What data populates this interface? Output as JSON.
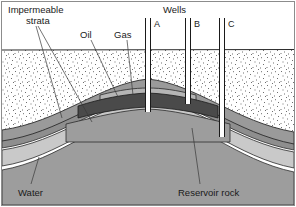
{
  "figure": {
    "title_text_present": false,
    "frame_color": "#8c8c8c",
    "background": "#ffffff"
  },
  "labels": {
    "impermeable_strata_line1": "Impermeable",
    "impermeable_strata_line2": "strata",
    "oil": "Oil",
    "gas": "Gas",
    "wells_header": "Wells",
    "well_a": "A",
    "well_b": "B",
    "well_c": "C",
    "water": "Water",
    "reservoir_rock": "Reservoir rock"
  },
  "layers": {
    "overburden": {
      "name": "overburden-stippled-rock",
      "fill": "#ffffff",
      "texture": "stipple-dots",
      "stroke": "#2b2b2b"
    },
    "cap_rock": {
      "name": "impermeable-cap-rock",
      "fill": "#9a9a9a",
      "stroke": "#2b2b2b"
    },
    "gas_cap": {
      "name": "gas-cap",
      "fill": "#b5b5b5",
      "stroke": "#2b2b2b"
    },
    "oil": {
      "name": "oil-zone",
      "fill": "#4a4a4a",
      "stroke": "#1a1a1a"
    },
    "reservoir_rock": {
      "name": "reservoir-rock",
      "fill": "#9d9d9d",
      "stroke": "#2b2b2b"
    },
    "water": {
      "name": "water-zone",
      "fill": "#c9c9c9",
      "stroke": "#2b2b2b"
    },
    "lower_seal": {
      "name": "lower-impermeable-strata",
      "fill": "#8e8e8e",
      "stroke": "#2b2b2b"
    }
  },
  "wells": [
    {
      "id": "A",
      "label": "A",
      "x": 148,
      "top_y": 18,
      "bottom_y": 112,
      "casing_width": 5
    },
    {
      "id": "B",
      "label": "B",
      "x": 188,
      "top_y": 18,
      "bottom_y": 104,
      "casing_width": 5
    },
    {
      "id": "C",
      "label": "C",
      "x": 222,
      "top_y": 18,
      "bottom_y": 137,
      "casing_width": 5
    }
  ],
  "structure": {
    "type": "anticline-trap",
    "ground_surface_y": 50,
    "crest_x": 148
  }
}
